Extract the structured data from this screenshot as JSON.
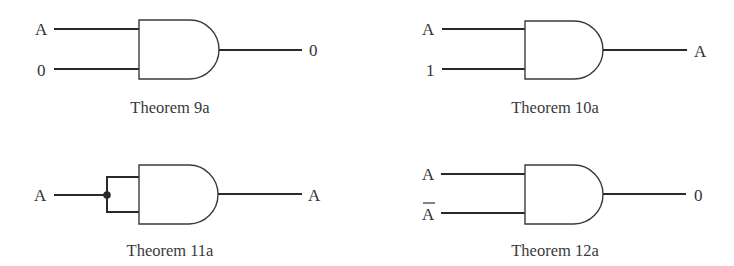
{
  "diagram": {
    "type": "logic-gate-theorems",
    "gate_type": "AND",
    "panels": [
      {
        "id": "t9a",
        "caption": "Theorem 9a",
        "inputs": [
          "A",
          "0"
        ],
        "output": "0"
      },
      {
        "id": "t10a",
        "caption": "Theorem 10a",
        "inputs": [
          "A",
          "1"
        ],
        "output": "A"
      },
      {
        "id": "t11a",
        "caption": "Theorem 11a",
        "inputs": [
          "A"
        ],
        "input_tied": true,
        "output": "A"
      },
      {
        "id": "t12a",
        "caption": "Theorem 12a",
        "inputs": [
          "A",
          "A"
        ],
        "input_overbar": [
          false,
          true
        ],
        "output": "0"
      }
    ]
  },
  "colors": {
    "line": "#2a2a2a",
    "text": "#333333",
    "background": "#ffffff"
  }
}
